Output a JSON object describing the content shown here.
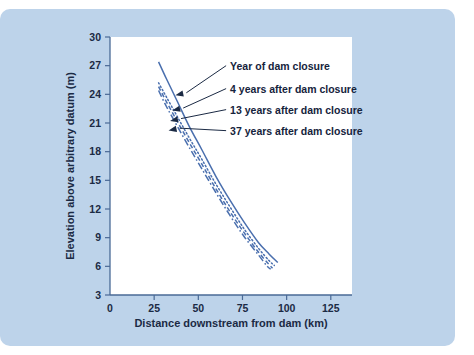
{
  "figure": {
    "panel_color": "#bdd3ea",
    "plot_background": "#ffffff",
    "line_color": "#4a6fae",
    "text_color": "#1b2a44"
  },
  "chart_data": {
    "type": "line",
    "title": "",
    "xlabel": "Distance downstream from dam (km)",
    "ylabel": "Elevation above arbitrary datum (m)",
    "xlim": [
      0,
      137
    ],
    "ylim": [
      3,
      30
    ],
    "xticks": [
      0,
      25,
      50,
      75,
      100,
      125
    ],
    "xtick_labels": [
      "0",
      "25",
      "50",
      "75",
      "100",
      "125"
    ],
    "yticks": [
      3,
      6,
      9,
      12,
      15,
      18,
      21,
      24,
      27,
      30
    ],
    "ytick_labels": [
      "3",
      "6",
      "9",
      "12",
      "15",
      "18",
      "21",
      "24",
      "27",
      "30"
    ],
    "grid": false,
    "legend_position": "inline-annotations",
    "series": [
      {
        "name": "Year of dam closure",
        "style": "solid",
        "x": [
          27.5,
          32,
          38,
          45,
          52,
          60,
          68,
          76,
          84,
          90,
          95
        ],
        "y": [
          27.4,
          25.6,
          23.3,
          20.6,
          18.2,
          15.4,
          12.9,
          10.6,
          8.5,
          7.3,
          6.4
        ]
      },
      {
        "name": "4 years after dam closure",
        "style": "dotted",
        "x": [
          27.5,
          32,
          38,
          45,
          52,
          60,
          68,
          76,
          84,
          90,
          93
        ],
        "y": [
          25.2,
          23.7,
          21.7,
          19.4,
          17.2,
          14.6,
          12.2,
          9.9,
          7.9,
          6.6,
          6.1
        ]
      },
      {
        "name": "13 years after dam closure",
        "style": "dashed",
        "x": [
          27.5,
          32,
          38,
          45,
          52,
          60,
          68,
          76,
          84,
          90,
          92
        ],
        "y": [
          24.8,
          23.2,
          21.2,
          18.9,
          16.7,
          14.1,
          11.7,
          9.5,
          7.5,
          6.2,
          5.8
        ]
      },
      {
        "name": "37 years after dam closure",
        "style": "dashdot",
        "x": [
          27.5,
          32,
          38,
          45,
          52,
          60,
          68,
          76,
          84,
          89,
          91
        ],
        "y": [
          24.4,
          22.7,
          20.7,
          18.4,
          16.2,
          13.7,
          11.3,
          9.1,
          7.2,
          6.0,
          5.7
        ]
      }
    ],
    "annotations": [
      {
        "text": "Year of dam closure",
        "label_x": 68,
        "label_y": 27.0
      },
      {
        "text": "4 years after dam closure",
        "label_x": 68,
        "label_y": 24.6
      },
      {
        "text": "13 years after dam closure",
        "label_x": 68,
        "label_y": 22.4
      },
      {
        "text": "37 years after dam closure",
        "label_x": 68,
        "label_y": 20.2
      }
    ]
  }
}
